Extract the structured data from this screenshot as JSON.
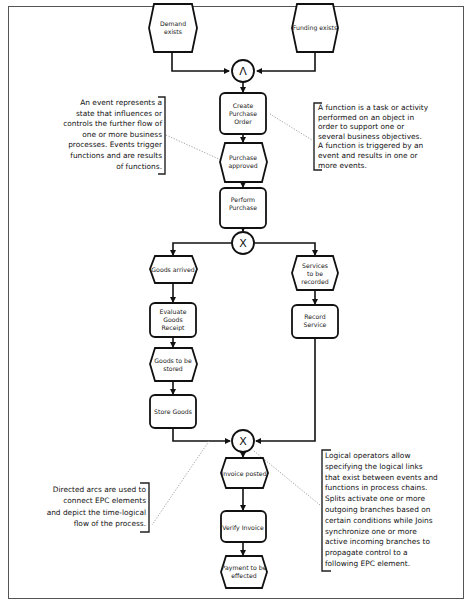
{
  "diagram": {
    "type": "EPC (Event-driven Process Chain)",
    "colors": {
      "stroke": "#111111",
      "background": "#ffffff",
      "frame": "#555555",
      "dotted_connector": "#888888"
    },
    "events": [
      {
        "id": "demand-exists",
        "lines": [
          "Demand",
          "exists"
        ]
      },
      {
        "id": "funding-exists",
        "lines": [
          "Funding exists"
        ]
      },
      {
        "id": "purchase-approved",
        "lines": [
          "Purchase",
          "approved"
        ]
      },
      {
        "id": "goods-arrived",
        "lines": [
          "Goods arrived"
        ]
      },
      {
        "id": "services-to-be-recorded",
        "lines": [
          "Services",
          "to be",
          "recorded"
        ]
      },
      {
        "id": "goods-to-be-stored",
        "lines": [
          "Goods to be",
          "stored"
        ]
      },
      {
        "id": "invoice-posted",
        "lines": [
          "Invoice posted"
        ]
      },
      {
        "id": "payment-to-be-effected",
        "lines": [
          "Payment to be",
          "effected"
        ]
      }
    ],
    "functions": [
      {
        "id": "create-purchase-order",
        "lines": [
          "Create",
          "Purchase",
          "Order"
        ]
      },
      {
        "id": "perform-purchase",
        "lines": [
          "Perform",
          "Purchase"
        ]
      },
      {
        "id": "evaluate-goods-receipt",
        "lines": [
          "Evaluate",
          "Goods",
          "Receipt"
        ]
      },
      {
        "id": "record-service",
        "lines": [
          "Record",
          "Service"
        ]
      },
      {
        "id": "store-goods",
        "lines": [
          "Store Goods"
        ]
      },
      {
        "id": "verify-invoice",
        "lines": [
          "Verify Invoice"
        ]
      }
    ],
    "operators": [
      {
        "id": "and-join",
        "symbol": "Λ",
        "meaning": "AND"
      },
      {
        "id": "xor-split",
        "symbol": "X",
        "meaning": "XOR"
      },
      {
        "id": "xor-join",
        "symbol": "X",
        "meaning": "XOR"
      }
    ],
    "callouts": {
      "event": "An event represents a\nstate that influences or\ncontrols the further flow of\none or more business\nprocesses. Events trigger\nfunctions and are results\nof functions.",
      "function": "A function is a task or activity\nperformed on an object in\norder to support one or\nseveral business objectives.\nA function is triggered by an\nevent and results in one or\nmore events.",
      "arcs": "Directed arcs are used to\nconnect EPC elements\nand depict the time-logical\nflow of the process.",
      "operators": "Logical operators allow\nspecifying the logical links\nthat exist between events and\nfunctions in process chains.\nSplits activate one or more\noutgoing branches based on\ncertain conditions while Joins\nsynchronize one or more\nactive incoming branches to\npropagate control to a\nfollowing EPC element."
    }
  }
}
